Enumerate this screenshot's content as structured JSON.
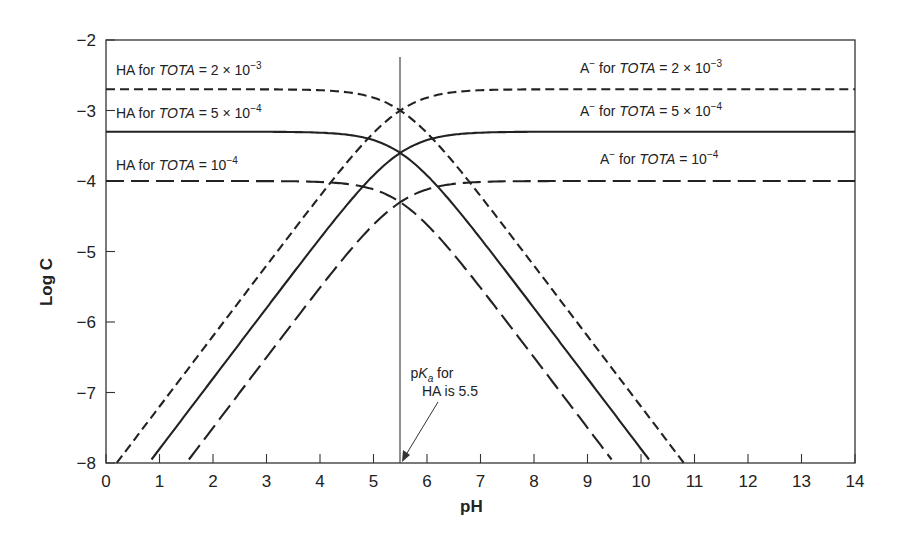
{
  "chart_data": {
    "type": "line",
    "title": "",
    "xlabel": "pH",
    "ylabel": "Log C",
    "xlim": [
      0,
      14
    ],
    "ylim": [
      -8,
      -2
    ],
    "xticks": [
      "0",
      "1",
      "2",
      "3",
      "4",
      "5",
      "6",
      "7",
      "8",
      "9",
      "10",
      "11",
      "12",
      "13",
      "14"
    ],
    "yticks": [
      "−2",
      "−3",
      "−4",
      "−5",
      "−6",
      "−7",
      "−8"
    ],
    "pKa": 5.5,
    "grid": false,
    "series": [
      {
        "name": "HA for TOTA = 2 × 10^-3",
        "species": "HA",
        "logTOT": -2.699,
        "style": "short-dash"
      },
      {
        "name": "A− for TOTA = 2 × 10^-3",
        "species": "A-",
        "logTOT": -2.699,
        "style": "short-dash"
      },
      {
        "name": "HA for TOTA = 5 × 10^-4",
        "species": "HA",
        "logTOT": -3.301,
        "style": "solid"
      },
      {
        "name": "A− for TOTA = 5 × 10^-4",
        "species": "A-",
        "logTOT": -3.301,
        "style": "solid"
      },
      {
        "name": "HA for TOTA = 10^-4",
        "species": "HA",
        "logTOT": -4.0,
        "style": "long-dash"
      },
      {
        "name": "A− for TOTA = 10^-4",
        "species": "A-",
        "logTOT": -4.0,
        "style": "long-dash"
      }
    ],
    "annotations": [
      {
        "text": "pKa for HA is 5.5",
        "x": 5.5,
        "y": -8
      }
    ]
  },
  "labels": {
    "ha_2e3": {
      "pre": "HA for ",
      "tot": "TOTA",
      "eq": " = 2 × 10",
      "exp": "−3"
    },
    "ha_5e4": {
      "pre": "HA for ",
      "tot": "TOTA",
      "eq": " = 5 × 10",
      "exp": "−4"
    },
    "ha_1e4": {
      "pre": "HA for ",
      "tot": "TOTA",
      "eq": " = 10",
      "exp": "−4"
    },
    "a_2e3": {
      "pre": "A",
      "sup": "−",
      "mid": " for ",
      "tot": "TOTA",
      "eq": " = 2 × 10",
      "exp": "−3"
    },
    "a_5e4": {
      "pre": "A",
      "sup": "−",
      "mid": " for ",
      "tot": "TOTA",
      "eq": " = 5 × 10",
      "exp": "−4"
    },
    "a_1e4": {
      "pre": "A",
      "sup": "−",
      "mid": " for ",
      "tot": "TOTA",
      "eq": " = 10",
      "exp": "−4"
    },
    "pka_line1_p": "p",
    "pka_line1_K": "K",
    "pka_line1_a": "a",
    "pka_line1_rest": " for",
    "pka_line2": "HA is 5.5"
  }
}
